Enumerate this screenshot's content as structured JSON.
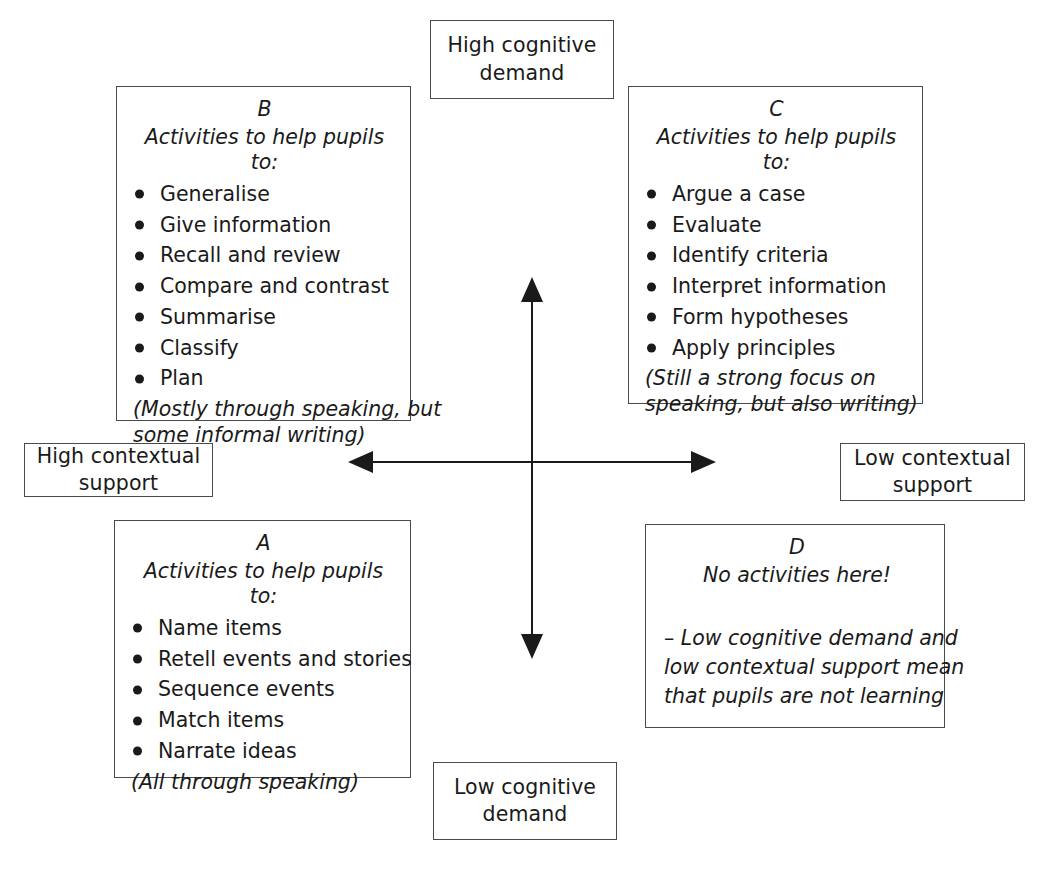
{
  "diagram": {
    "axes": {
      "top_label": {
        "line1": "High cognitive",
        "line2": "demand"
      },
      "bottom_label": {
        "line1": "Low cognitive",
        "line2": "demand"
      },
      "left_label": {
        "line1": "High contextual",
        "line2": "support"
      },
      "right_label": {
        "line1": "Low contextual",
        "line2": "support"
      },
      "vertical_axis_name": "cognitive-demand-axis",
      "horizontal_axis_name": "contextual-support-axis",
      "line_color": "#1a1a1a"
    },
    "quadrants": {
      "b": {
        "letter": "B",
        "intro": "Activities to help pupils to:",
        "items": [
          "Generalise",
          "Give information",
          "Recall and review",
          "Compare and contrast",
          "Summarise",
          "Classify",
          "Plan"
        ],
        "note_line1": "(Mostly through speaking, but",
        "note_line2": "some informal writing)"
      },
      "c": {
        "letter": "C",
        "intro": "Activities to help pupils to:",
        "items": [
          "Argue a case",
          "Evaluate",
          "Identify criteria",
          "Interpret information",
          "Form hypotheses",
          "Apply principles"
        ],
        "note_line1": "(Still a strong focus on",
        "note_line2": "speaking, but also writing)"
      },
      "a": {
        "letter": "A",
        "intro": "Activities to help pupils to:",
        "items": [
          "Name items",
          "Retell events and stories",
          "Sequence events",
          "Match items",
          "Narrate ideas"
        ],
        "note_line1": "(All through speaking)",
        "note_line2": ""
      },
      "d": {
        "letter": "D",
        "title": "No activities here!",
        "body_line1": "– Low cognitive demand and",
        "body_line2": "low contextual support mean",
        "body_line3": "that pupils are not learning"
      }
    }
  }
}
